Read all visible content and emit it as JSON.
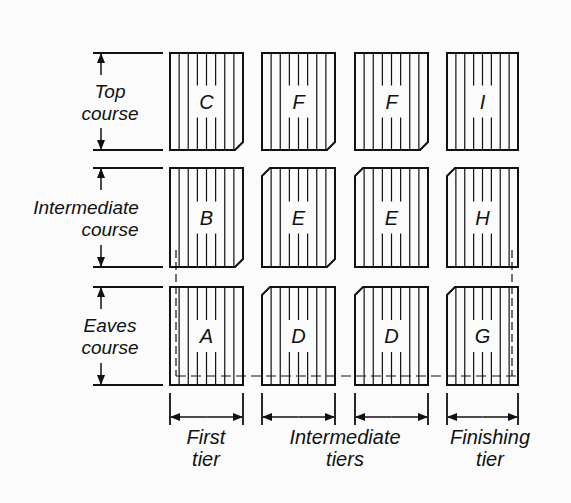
{
  "figure": {
    "colors": {
      "ink": "#111111",
      "background": "#fbfbfb"
    }
  },
  "rows": [
    {
      "label_lines": [
        "Top",
        "course"
      ],
      "y": 53,
      "h": 97
    },
    {
      "label_lines": [
        "Intermediate",
        "course"
      ],
      "y": 168,
      "h": 99
    },
    {
      "label_lines": [
        "Eaves",
        "course"
      ],
      "y": 287,
      "h": 98
    }
  ],
  "columns": [
    {
      "x": 170,
      "w": 73
    },
    {
      "x": 262,
      "w": 73
    },
    {
      "x": 355,
      "w": 73
    },
    {
      "x": 447,
      "w": 71
    }
  ],
  "shingles": [
    [
      "C",
      "F",
      "F",
      "I"
    ],
    [
      "B",
      "E",
      "E",
      "H"
    ],
    [
      "A",
      "D",
      "D",
      "G"
    ]
  ],
  "tier_labels": [
    {
      "lines": [
        "First",
        "tier"
      ],
      "cx": 206
    },
    {
      "lines": [
        "Intermediate",
        "tiers"
      ],
      "cx": 345
    },
    {
      "lines": [
        "Finishing",
        "tier"
      ],
      "cx": 490
    }
  ]
}
